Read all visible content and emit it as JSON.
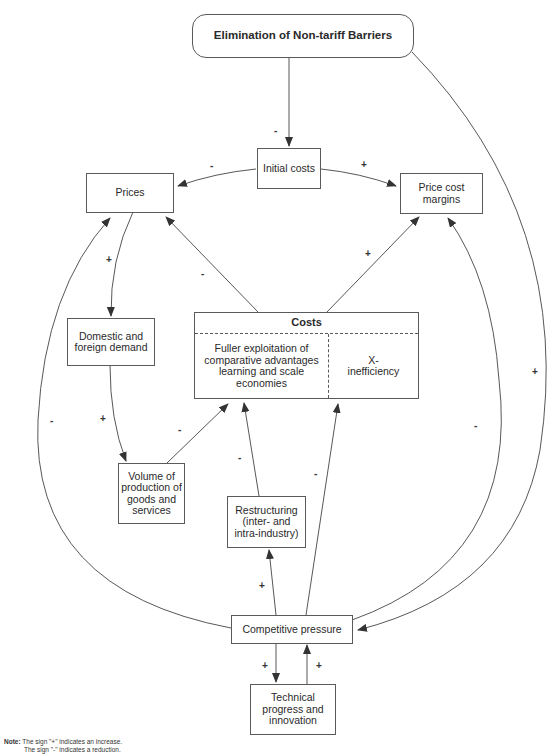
{
  "diagram": {
    "nodes": {
      "title": "Elimination of Non-tariff Barriers",
      "initial_costs": "Initial costs",
      "prices": "Prices",
      "price_cost_margins": "Price cost margins",
      "domestic_demand": "Domestic and foreign demand",
      "costs_header": "Costs",
      "costs_left": "Fuller exploitation of comparative advantages learning and scale economies",
      "costs_right": "X-inefficiency",
      "volume": "Volume of production of goods and services",
      "restructuring": "Restructuring (inter- and intra-industry)",
      "competitive_pressure": "Competitive pressure",
      "technical_progress": "Technical progress and innovation"
    },
    "signs": {
      "title_to_initial": "-",
      "initial_to_prices": "-",
      "initial_to_margins": "+",
      "prices_to_demand": "+",
      "costs_to_prices": "-",
      "costs_to_margins": "+",
      "demand_to_volume": "+",
      "volume_to_costs": "-",
      "competition_to_prices": "-",
      "restructuring_to_costs": "-",
      "competition_to_xineff": "-",
      "competition_to_margins": "-",
      "title_to_competition": "+",
      "competition_to_restructuring": "+",
      "competition_to_technical": "+",
      "technical_to_competition": "+"
    },
    "note": {
      "label": "Note:",
      "line1": "The sign \"+\" indicates an increase.",
      "line2": "The sign \"-\" indicates a reduction."
    },
    "edges": [
      {
        "from": "Elimination of Non-tariff Barriers",
        "to": "Initial costs",
        "sign": "-"
      },
      {
        "from": "Initial costs",
        "to": "Prices",
        "sign": "-"
      },
      {
        "from": "Initial costs",
        "to": "Price cost margins",
        "sign": "+"
      },
      {
        "from": "Prices",
        "to": "Domestic and foreign demand",
        "sign": "+"
      },
      {
        "from": "Costs",
        "to": "Prices",
        "sign": "-"
      },
      {
        "from": "Costs",
        "to": "Price cost margins",
        "sign": "+"
      },
      {
        "from": "Domestic and foreign demand",
        "to": "Volume of production of goods and services",
        "sign": "+"
      },
      {
        "from": "Volume of production of goods and services",
        "to": "Costs",
        "sign": "-"
      },
      {
        "from": "Competitive pressure",
        "to": "Prices",
        "sign": "-"
      },
      {
        "from": "Restructuring",
        "to": "Costs",
        "sign": "-"
      },
      {
        "from": "Competitive pressure",
        "to": "X-inefficiency",
        "sign": "-"
      },
      {
        "from": "Competitive pressure",
        "to": "Price cost margins",
        "sign": "-"
      },
      {
        "from": "Elimination of Non-tariff Barriers",
        "to": "Competitive pressure",
        "sign": "+"
      },
      {
        "from": "Competitive pressure",
        "to": "Restructuring",
        "sign": "+"
      },
      {
        "from": "Competitive pressure",
        "to": "Technical progress and innovation",
        "sign": "+"
      },
      {
        "from": "Technical progress and innovation",
        "to": "Competitive pressure",
        "sign": "+"
      }
    ]
  }
}
